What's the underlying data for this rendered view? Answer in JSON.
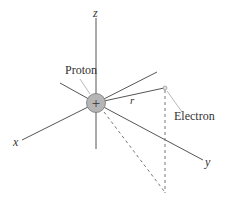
{
  "diagram": {
    "type": "3d-coordinate-diagram",
    "axes": [
      {
        "name": "x",
        "label": "x"
      },
      {
        "name": "y",
        "label": "y"
      },
      {
        "name": "z",
        "label": "z"
      }
    ],
    "labels": {
      "proton": "Proton",
      "electron": "Electron",
      "distance": "r",
      "proton_charge": "+"
    },
    "colors": {
      "axis": "#555555",
      "proton_fill": "#b5b5b5",
      "dashed": "#777777",
      "text": "#333333"
    }
  }
}
